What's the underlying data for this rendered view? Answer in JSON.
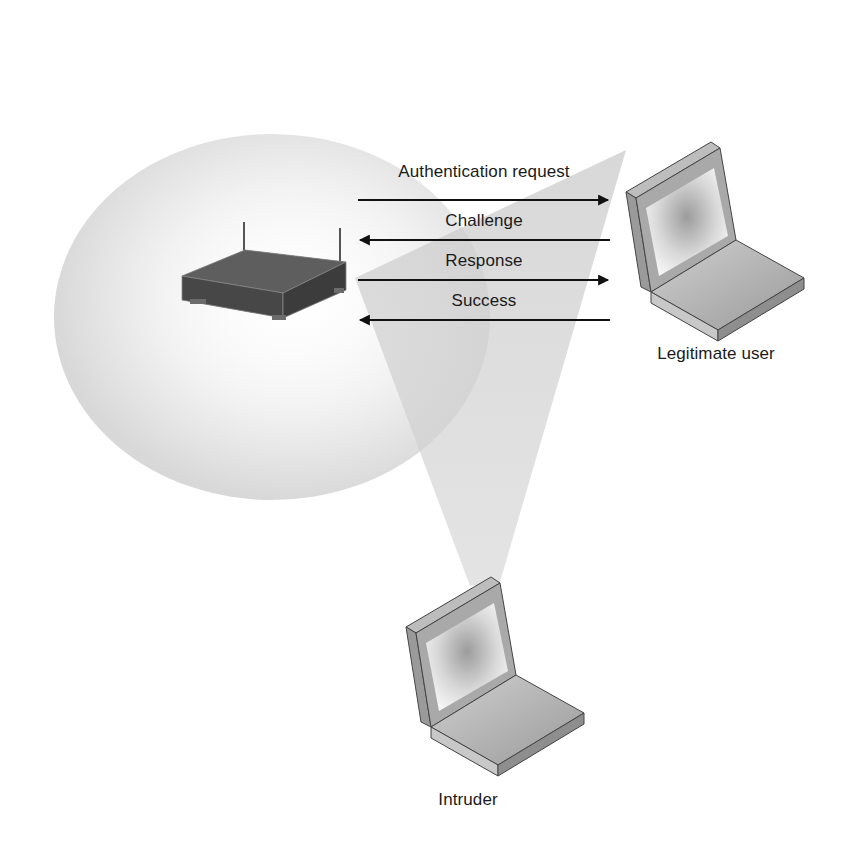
{
  "diagram": {
    "messages": [
      {
        "label": "Authentication request",
        "direction": "to-user",
        "y": 200
      },
      {
        "label": "Challenge",
        "direction": "to-ap",
        "y": 240
      },
      {
        "label": "Response",
        "direction": "to-user",
        "y": 280
      },
      {
        "label": "Success",
        "direction": "to-ap",
        "y": 320
      }
    ],
    "nodes": {
      "access_point": {
        "label": ""
      },
      "legitimate_user": {
        "label": "Legitimate user"
      },
      "intruder": {
        "label": "Intruder"
      }
    },
    "colors": {
      "coverage_area": "#d9d9d9",
      "eavesdrop_cone": "#cfcfcf",
      "arrow": "#111111",
      "device_body": "#5a5a5a",
      "laptop_frame": "#a8a8a8"
    }
  }
}
